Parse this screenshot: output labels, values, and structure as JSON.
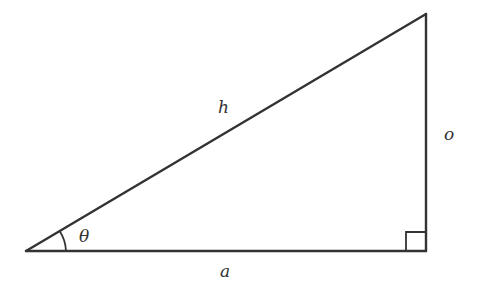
{
  "diagram": {
    "type": "right-triangle",
    "stroke_color": "#333333",
    "labels": {
      "hypotenuse": "h",
      "opposite": "o",
      "adjacent": "a",
      "angle": "θ"
    },
    "vertices": {
      "angle_vertex": [
        26,
        251
      ],
      "right_angle_vertex": [
        426,
        251
      ],
      "top_vertex": [
        426,
        14
      ]
    },
    "markers": {
      "right_angle_square": true,
      "angle_arc": true
    }
  }
}
